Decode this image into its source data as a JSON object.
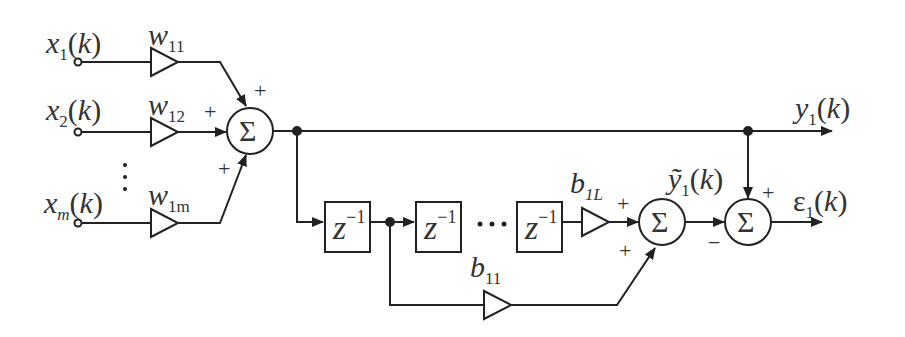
{
  "diagram": {
    "type": "block-diagram",
    "inputs": [
      {
        "name": "x",
        "sub": "1",
        "arg": "(k)"
      },
      {
        "name": "x",
        "sub": "2",
        "arg": "(k)"
      },
      {
        "name": "x",
        "sub": "m",
        "arg": "(k)"
      }
    ],
    "input_ellipsis": "⋮",
    "weights": [
      {
        "name": "w",
        "sub": "11"
      },
      {
        "name": "w",
        "sub": "12"
      },
      {
        "name": "w",
        "sub": "1m"
      }
    ],
    "summer1": {
      "symbol": "Σ",
      "signs": [
        "+",
        "+",
        "+"
      ]
    },
    "output": {
      "name": "y",
      "sub": "1",
      "arg": "(k)"
    },
    "delays": [
      {
        "base": "z",
        "exp": "−1"
      },
      {
        "base": "z",
        "exp": "−1"
      },
      {
        "base": "z",
        "exp": "−1"
      }
    ],
    "delay_ellipsis": "···",
    "taps": [
      {
        "name": "b",
        "sub": "11"
      },
      {
        "name": "b",
        "sub": "1L"
      }
    ],
    "summer2": {
      "symbol": "Σ",
      "signs": [
        "+",
        "+"
      ]
    },
    "estimate": {
      "name": "ỹ",
      "sub": "1",
      "arg": "(k)"
    },
    "summer3": {
      "symbol": "Σ",
      "signs": [
        "+",
        "−"
      ]
    },
    "error": {
      "name": "ε",
      "sub": "1",
      "arg": "(k)"
    }
  }
}
